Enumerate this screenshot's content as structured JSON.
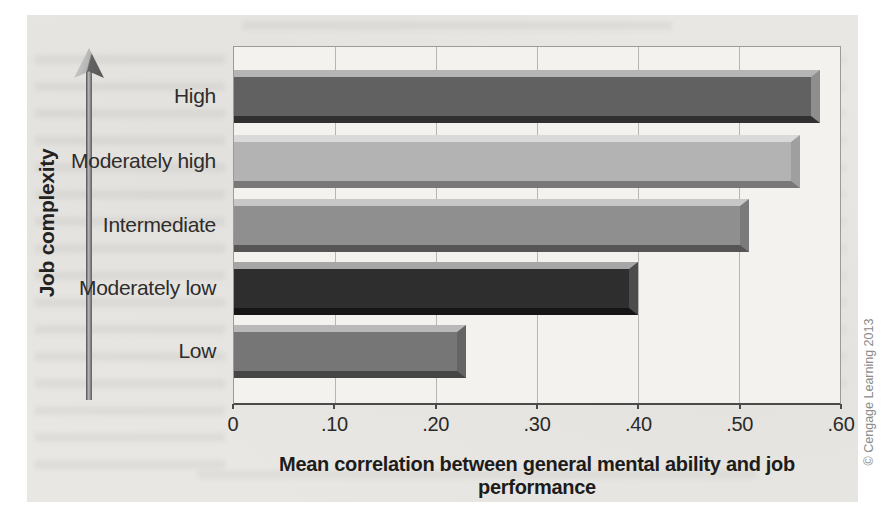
{
  "figure": {
    "y_axis_title": "Job complexity",
    "x_axis_title": "Mean correlation between general mental ability and job performance",
    "credit": "© Cengage Learning 2013"
  },
  "chart_data": {
    "type": "bar",
    "orientation": "horizontal",
    "title": "",
    "xlabel": "Mean correlation between general mental ability and job performance",
    "ylabel": "Job complexity",
    "categories": [
      "High",
      "Moderately high",
      "Intermediate",
      "Moderately low",
      "Low"
    ],
    "values": [
      0.58,
      0.56,
      0.51,
      0.4,
      0.23
    ],
    "xlim": [
      0,
      0.6
    ],
    "xtick_labels": [
      "0",
      ".10",
      ".20",
      ".30",
      ".40",
      ".50",
      ".60"
    ],
    "grid": "vertical",
    "legend": "none",
    "colors": {
      "plot_background": "#f3f2ef",
      "panel_background": "#e8e7e4",
      "gridline": "#b8b6b1",
      "axis_line": "#4b4b4b"
    },
    "bar_styles": [
      {
        "body": "#616161",
        "top": "#b5b5b5",
        "right": "#8e8e8e",
        "bottom": "#303030"
      },
      {
        "body": "#b3b3b3",
        "top": "#d9d9d9",
        "right": "#9f9f9f",
        "bottom": "#787878"
      },
      {
        "body": "#8f8f8f",
        "top": "#c7c7c7",
        "right": "#7b7b7b",
        "bottom": "#555555"
      },
      {
        "body": "#2e2e2e",
        "top": "#a6a6a6",
        "right": "#4c4c4c",
        "bottom": "#161616"
      },
      {
        "body": "#767676",
        "top": "#b9b9b9",
        "right": "#646464",
        "bottom": "#454545"
      }
    ]
  }
}
